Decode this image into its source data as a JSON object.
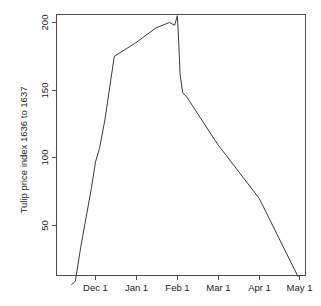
{
  "chart_data": {
    "type": "line",
    "title": "",
    "subtitle": "",
    "xlabel": "",
    "ylabel": "Tulip price index 1636 to 1637",
    "xlim": [
      0,
      182
    ],
    "ylim": [
      0,
      212
    ],
    "grid": false,
    "legend": null,
    "y_ticks": [
      50,
      100,
      150,
      200
    ],
    "y_tick_labels": [
      "50",
      "100",
      "150",
      "200"
    ],
    "x_ticks": [
      23,
      53,
      84,
      114,
      145,
      175
    ],
    "x_tick_labels": [
      "Dec 1",
      "Jan 1",
      "Feb 1",
      "Mar 1",
      "Apr 1",
      "May 1"
    ],
    "series": [
      {
        "name": "Tulip price index",
        "x": [
          5,
          8,
          12,
          16,
          20,
          23,
          26,
          30,
          37,
          53,
          68,
          78,
          82,
          84,
          85,
          86,
          88,
          91,
          114,
          145,
          174
        ],
        "y": [
          6,
          9,
          34,
          56,
          78,
          97,
          107,
          128,
          175,
          185,
          196,
          200,
          198,
          205,
          186,
          162,
          148,
          145,
          110,
          70,
          12
        ]
      }
    ]
  },
  "axis": {
    "y_title": "Tulip price index 1636 to 1637",
    "y_labels": [
      "200",
      "150",
      "100",
      "50"
    ],
    "x_labels": [
      "Dec 1",
      "Jan 1",
      "Feb 1",
      "Mar 1",
      "Apr 1",
      "May 1"
    ]
  },
  "style": {
    "line_color": "#3a3a3a",
    "axis_color": "#4d4d4d",
    "text_color": "#1a1a1a",
    "background": "#ffffff"
  }
}
